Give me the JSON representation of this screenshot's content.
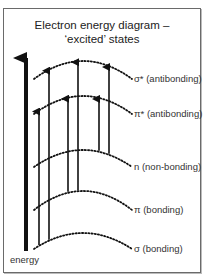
{
  "title_line1": "Electron energy diagram –",
  "title_line2": "‘excited’ states",
  "axis_label": "energy",
  "levels": [
    {
      "id": "sigma-star",
      "label": "σ* (antibonding)"
    },
    {
      "id": "pi-star",
      "label": "π* (antibonding)"
    },
    {
      "id": "n",
      "label": "n (non-bonding)"
    },
    {
      "id": "pi",
      "label": "π (bonding)"
    },
    {
      "id": "sigma",
      "label": "σ (bonding)"
    }
  ],
  "transitions": [
    {
      "from": "sigma",
      "to": "pi-star"
    },
    {
      "from": "sigma",
      "to": "sigma-star"
    },
    {
      "from": "pi",
      "to": "pi-star"
    },
    {
      "from": "pi",
      "to": "sigma-star"
    },
    {
      "from": "n",
      "to": "pi-star"
    },
    {
      "from": "n",
      "to": "sigma-star"
    }
  ]
}
